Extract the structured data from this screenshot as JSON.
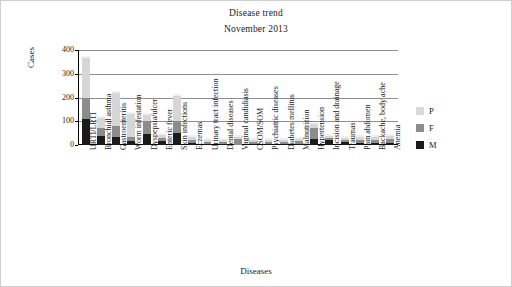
{
  "chart_data": {
    "type": "bar",
    "title": "Disease trend",
    "subtitle": "November 2013",
    "xlabel": "Diseases",
    "ylabel": "Cases",
    "ylim": [
      0,
      400
    ],
    "yticks": [
      0,
      100,
      200,
      300,
      400
    ],
    "grid": true,
    "stacked": true,
    "legend_position": "right",
    "categories": [
      "URTI/LRTI",
      "Bronchial asthma",
      "Gastroenteritis",
      "Worm infestation",
      "Dyspepsia/ulcer",
      "Enteric fever",
      "Skin infections",
      "Eczemas",
      "Urinary tract infection",
      "Dental diseases",
      "Vaginal candidiasis",
      "CSOM/SOM",
      "Psychiatric diseases",
      "Diabetes mellitus",
      "Malnutrition",
      "Hypertension",
      "Incision and drainage",
      "Traumas",
      "Pain abdomen",
      "Backache, body ache",
      "Anemia"
    ],
    "series": [
      {
        "name": "M",
        "color": "#1b1b1b",
        "values": [
          110,
          40,
          35,
          15,
          45,
          15,
          50,
          10,
          5,
          5,
          0,
          5,
          5,
          5,
          5,
          25,
          20,
          12,
          10,
          10,
          10
        ]
      },
      {
        "name": "F",
        "color": "#8c8c8c",
        "values": [
          90,
          30,
          45,
          20,
          55,
          15,
          50,
          12,
          8,
          8,
          25,
          8,
          8,
          8,
          10,
          45,
          10,
          10,
          12,
          12,
          15
        ]
      },
      {
        "name": "P",
        "color": "#d9d9d9",
        "values": [
          165,
          45,
          140,
          95,
          25,
          12,
          105,
          10,
          7,
          10,
          10,
          10,
          10,
          10,
          10,
          20,
          8,
          8,
          10,
          10,
          12
        ]
      }
    ],
    "legend": [
      {
        "label": "P",
        "color": "#d9d9d9"
      },
      {
        "label": "F",
        "color": "#8c8c8c"
      },
      {
        "label": "M",
        "color": "#1b1b1b"
      }
    ]
  }
}
